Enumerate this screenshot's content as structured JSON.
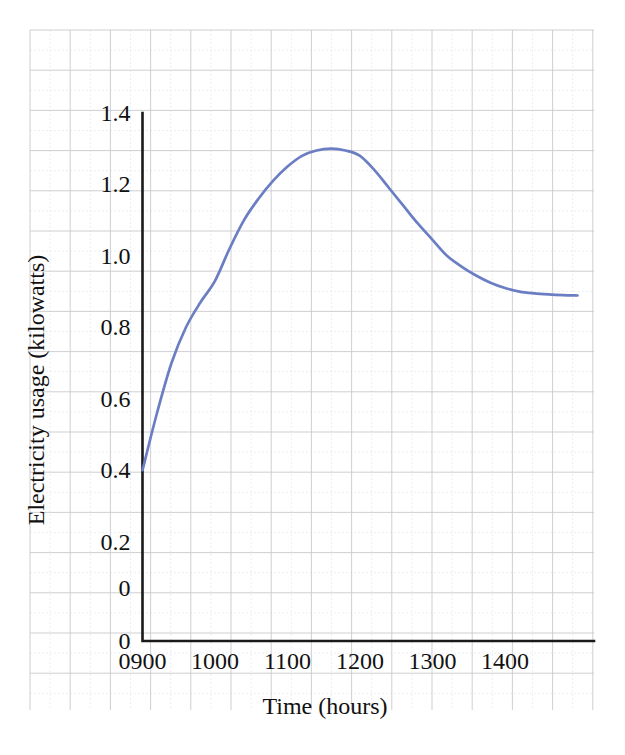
{
  "chart_data": {
    "type": "line",
    "title": "",
    "subtitle": "",
    "xlabel": "Time (hours)",
    "ylabel": "Electricity usage (kilowatts)",
    "xlim": [
      900,
      1500
    ],
    "ylim": [
      0,
      1.4
    ],
    "grid": true,
    "legend": "none",
    "x_tick_labels": [
      "0900",
      "1000",
      "1100",
      "1200",
      "1300",
      "1400"
    ],
    "x_tick_values": [
      900,
      1000,
      1100,
      1200,
      1300,
      1400
    ],
    "y_tick_labels": [
      "0",
      "0",
      "0.2",
      "0.4",
      "0.6",
      "0.8",
      "1.0",
      "1.2",
      "1.4"
    ],
    "y_tick_values": [
      0,
      0,
      0.2,
      0.4,
      0.6,
      0.8,
      1.0,
      1.2,
      1.4
    ],
    "series": [
      {
        "name": "Electricity usage",
        "color": "#6b7ec4",
        "x": [
          900,
          920,
          940,
          960,
          980,
          1000,
          1020,
          1040,
          1060,
          1080,
          1100,
          1120,
          1140,
          1160,
          1180,
          1200,
          1220,
          1240,
          1260,
          1280,
          1300,
          1320,
          1340,
          1360,
          1380,
          1400,
          1420,
          1440,
          1460,
          1480,
          1500
        ],
        "values": [
          0.4,
          0.56,
          0.7,
          0.8,
          0.87,
          0.93,
          1.02,
          1.1,
          1.16,
          1.21,
          1.25,
          1.28,
          1.295,
          1.3,
          1.295,
          1.28,
          1.24,
          1.19,
          1.14,
          1.09,
          1.045,
          1.0,
          0.97,
          0.945,
          0.925,
          0.91,
          0.9,
          0.895,
          0.892,
          0.89,
          0.889
        ]
      }
    ]
  },
  "axis": {
    "y_title": "Electricity usage (kilowatts)",
    "x_title": "Time (hours)"
  },
  "ticks": {
    "y": [
      {
        "label": "1.4",
        "value": 1.4
      },
      {
        "label": "1.2",
        "value": 1.2
      },
      {
        "label": "1.0",
        "value": 1.0
      },
      {
        "label": "0.8",
        "value": 0.8
      },
      {
        "label": "0.6",
        "value": 0.6
      },
      {
        "label": "0.4",
        "value": 0.4
      },
      {
        "label": "0.2",
        "value": 0.2
      },
      {
        "label": "0",
        "value": 0.07
      },
      {
        "label": "0",
        "value": 0.0
      }
    ],
    "x": [
      {
        "label": "0900",
        "value": 900
      },
      {
        "label": "1000",
        "value": 1000
      },
      {
        "label": "1100",
        "value": 1100
      },
      {
        "label": "1200",
        "value": 1200
      },
      {
        "label": "1300",
        "value": 1300
      },
      {
        "label": "1400",
        "value": 1400
      }
    ]
  },
  "style": {
    "series_color": "#6b7ec4",
    "axis_color": "#1a1a1a",
    "grid_major_color": "#c9c9cf",
    "grid_minor_color": "#e3e3e8",
    "background": "#ffffff"
  }
}
